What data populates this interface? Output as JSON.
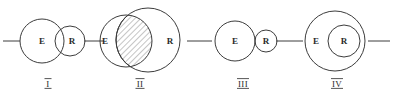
{
  "figure": {
    "stroke_color": "#3c3c3c",
    "text_color": "#2b2b2b",
    "background_color": "#ffffff",
    "hatch_color": "#6e6e6e"
  },
  "panels": [
    {
      "numeral": "I",
      "relation": "partial-overlap",
      "sets": [
        {
          "name": "E",
          "label": "E",
          "role": "large-left-circle",
          "shaded": false
        },
        {
          "name": "R",
          "label": "R",
          "role": "small-right-circle",
          "shaded": false
        }
      ]
    },
    {
      "numeral": "II",
      "relation": "E-mostly-inside-R",
      "sets": [
        {
          "name": "E",
          "label": "E",
          "role": "small-left-circle",
          "shaded": false
        },
        {
          "name": "R",
          "label": "R",
          "role": "large-right-circle",
          "shaded": false
        }
      ],
      "shaded_region": "intersection-of-E-and-R"
    },
    {
      "numeral": "III",
      "relation": "disjoint-tangent",
      "sets": [
        {
          "name": "E",
          "label": "E",
          "role": "large-left-circle",
          "shaded": false
        },
        {
          "name": "R",
          "label": "R",
          "role": "small-right-circle",
          "shaded": false
        }
      ]
    },
    {
      "numeral": "IV",
      "relation": "R-inside-E",
      "sets": [
        {
          "name": "E",
          "label": "E",
          "role": "large-outer-circle",
          "shaded": false
        },
        {
          "name": "R",
          "label": "R",
          "role": "small-inner-circle",
          "shaded": true
        }
      ],
      "shaded_region": "R"
    }
  ]
}
